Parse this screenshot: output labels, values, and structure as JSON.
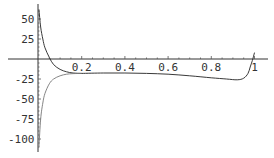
{
  "chart_data": {
    "type": "line",
    "title": "",
    "xlabel": "",
    "ylabel": "",
    "xlim": [
      0,
      1.03
    ],
    "ylim": [
      -110,
      62
    ],
    "grid": false,
    "legend": null,
    "x_ticks": [
      "0.2",
      "0.4",
      "0.6",
      "0.8",
      "1"
    ],
    "y_ticks": [
      "50",
      "25",
      "-25",
      "-50",
      "-75",
      "-100"
    ],
    "series": [
      {
        "name": "upper branch",
        "x": [
          0.002,
          0.01,
          0.02,
          0.03,
          0.05,
          0.07,
          0.1,
          0.13,
          0.16,
          0.2
        ],
        "y": [
          62,
          40,
          25,
          14,
          2,
          -7,
          -13,
          -16,
          -17.5,
          -18
        ]
      },
      {
        "name": "lower branch",
        "x": [
          0.002,
          0.01,
          0.02,
          0.03,
          0.05,
          0.07,
          0.1,
          0.13,
          0.16,
          0.2
        ],
        "y": [
          -110,
          -75,
          -55,
          -43,
          -31,
          -25,
          -21,
          -19,
          -18.3,
          -18
        ]
      },
      {
        "name": "main curve",
        "x": [
          0.2,
          0.3,
          0.4,
          0.5,
          0.6,
          0.7,
          0.8,
          0.87,
          0.92,
          0.95,
          0.97,
          0.98,
          0.99,
          1.0
        ],
        "y": [
          -18,
          -17.5,
          -17.5,
          -18,
          -19,
          -21,
          -23.5,
          -25,
          -26,
          -24,
          -18,
          -10,
          -2,
          8
        ]
      }
    ]
  }
}
